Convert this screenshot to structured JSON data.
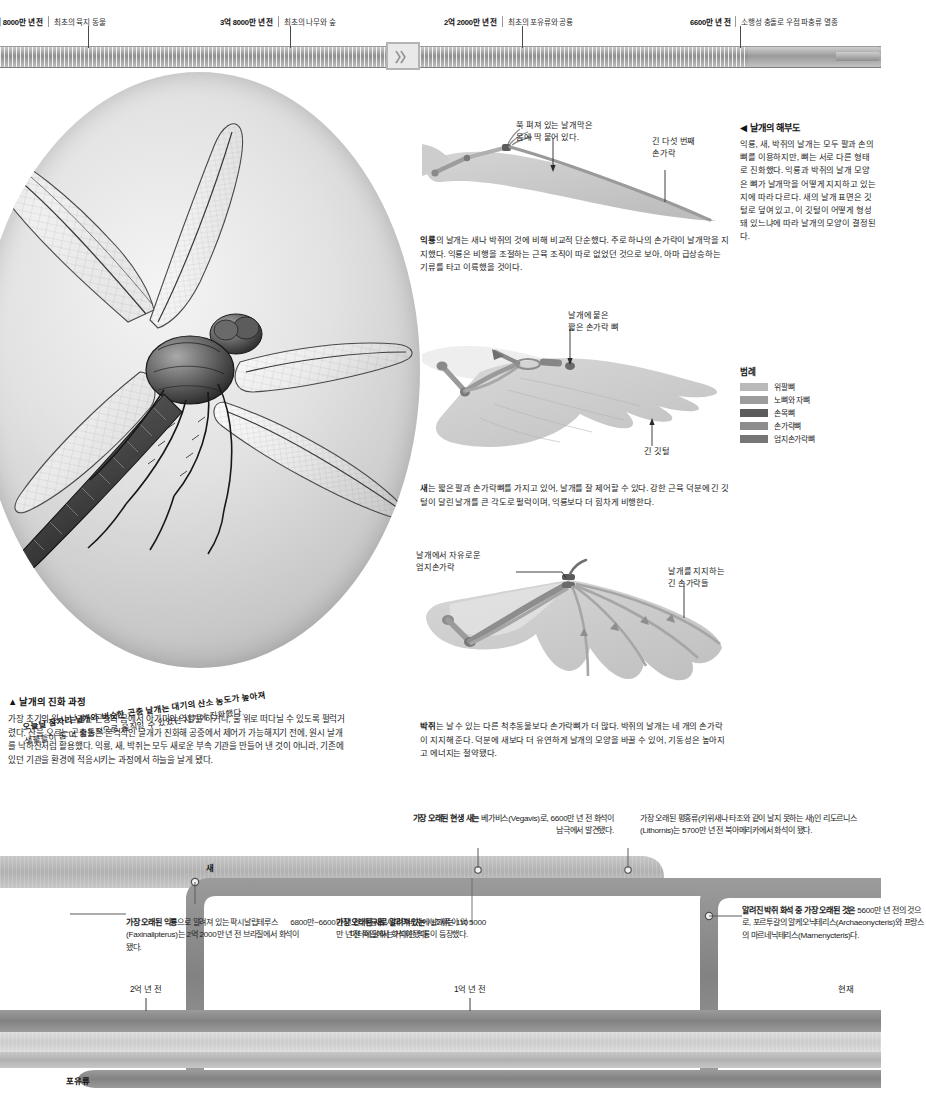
{
  "top_timeline": {
    "events": [
      {
        "age": "4억 8000만 년 전",
        "event": "최초의 육지 동물",
        "x": 88
      },
      {
        "age": "3억 8000만 년 전",
        "event": "최초의 나무와 숲",
        "x": 290
      },
      {
        "age": "2억 2000만 년 전",
        "event": "최초의 포유류와 공룡",
        "x": 522
      },
      {
        "age": "6600만 년 전",
        "event": "소행성 충돌로 우점 파충류 멸종",
        "x": 740
      }
    ],
    "break_glyph": "〉〉"
  },
  "dragonfly": {
    "caption_line1": "오늘날 잠자리 날개와 비슷한 곤충 날개는 대기의 산소 농도가 높아져",
    "caption_line2": "생물들이 좀 더 활동적으로 움직일 수 있었던 시기에 진화했다."
  },
  "evolution": {
    "heading": "▲ 날개의 진화 과정",
    "body": "가장 초기의 원시 날개는 곤충의 몸에서 아가미의 역할을 하거나, 물 위로 떠다닐 수 있도록 펄럭거렸다. 산을 오르는 곤충들은 본격적인 날개가 진화해 공중에서 제어가 가능해지기 전에, 원시 날개를 낙하산처럼 활용했다. 익룡, 새, 박쥐는 모두 새로운 부속 기관을 만들어 낸 것이 아니라, 기존에 있던 기관을 환경에 적응시키는 과정에서 하늘을 날게 됐다."
  },
  "anatomy": {
    "heading": "◀ 날개의 해부도",
    "body": "익룡, 새, 박쥐의 날개는 모두 팔과 손의 뼈를 이용하지만, 뼈는 서로 다른 형태로 진화했다. 익룡과 박쥐의 날개 모양은 뼈가 날개막을 어떻게 지지하고 있는지에 따라 다르다. 새의 날개 표면은 깃털로 덮여 있고, 이 깃털이 어떻게 형성돼 있느냐에 따라 날개의 모양이 결정된다."
  },
  "legend": {
    "title": "범례",
    "items": [
      {
        "label": "위팔뼈",
        "color": "#b9b9b9"
      },
      {
        "label": "노뼈와 자뼈",
        "color": "#9d9d9d"
      },
      {
        "label": "손목뼈",
        "color": "#5c5c5c"
      },
      {
        "label": "손가락뼈",
        "color": "#8c8c8c"
      },
      {
        "label": "엄지손가락뼈",
        "color": "#767676"
      }
    ]
  },
  "diagrams": [
    {
      "id": "pterosaur",
      "note_top": "쭉 펴져 있는 날개막은\n몸에 딱 붙어 있다.",
      "note_right": "긴 다섯 번째\n손가락",
      "caption_lead": "익룡",
      "caption_rest": "의 날개는 새나 박쥐의 것에 비해 비교적 단순했다. 주로 하나의 손가락이 날개막을 지지했다. 익룡은 비행을 조절하는 근육 조직이 따로 없었던 것으로 보아, 아마 급상승하는 기류를 타고 이륙했을 것이다."
    },
    {
      "id": "bird",
      "note_top": "날개에 붙은\n짧은 손가락 뼈",
      "note_bottom": "긴 깃털",
      "caption_lead": "새",
      "caption_rest": "는 짧은 팔과 손가락뼈를 가지고 있어, 날개를 잘 제어할 수 있다. 강한 근육 덕분에 긴 깃털이 달린 날개를 큰 각도로 펄럭이며, 익룡보다 더 힘차게 비행한다."
    },
    {
      "id": "bat",
      "note_left": "날개에서 자유로운\n엄지손가락",
      "note_right": "날개를 지지하는\n긴 손가락들",
      "caption_lead": "박쥐",
      "caption_rest": "는 날 수 있는 다른 척추동물보다 손가락뼈가 더 많다. 박쥐의 날개는 네 개의 손가락이 지지해 준다. 덕분에 새보다 더 유연하게 날개의 모양을 바꿀 수 있어, 기동성은 높아지고 에너지는 절약됐다."
    }
  ],
  "bottom_timeline": {
    "axis_ticks": [
      {
        "label": "2억 년 전",
        "x": 146
      },
      {
        "label": "1억 년 전",
        "x": 470
      },
      {
        "label": "현재",
        "x": 840
      }
    ],
    "track_labels": [
      {
        "label": "새",
        "x": 338,
        "y": 861
      },
      {
        "label": "포유류",
        "x": 68,
        "y": 1060
      }
    ],
    "notes": [
      {
        "id": "oldest-pterosaur",
        "align": "left",
        "x": 130,
        "y": 903,
        "w": 170,
        "bold": "가장 오래된 익룡",
        "rest": "으로 알려져 있는 팍시날립테루스(Faxinalipterus)는 2억 2000만 년 전 브라질에서 화석이 됐다."
      },
      {
        "id": "oldest-bird",
        "align": "left",
        "x": 340,
        "y": 903,
        "w": 150,
        "bold": "가장 오래된 새로 알려져 있는",
        "rest": " 시조새는 1억 5000만 년 전 독일에서 화석이 됐다."
      },
      {
        "id": "giant-pterosaur",
        "align": "right",
        "x": 478,
        "y": 903,
        "w": 178,
        "bold": "",
        "rest": "6800만~6600만 년 전, 익룡의 시대 막바지에 날개폭이 10미터에 달하는 거대한 익룡이 등장했다."
      },
      {
        "id": "oldest-living-bird",
        "align": "right",
        "x": 410,
        "y": 800,
        "w": 205,
        "bold": "가장 오래된 현생 새는",
        "rest": " 베가비스(Vegavis)로, 6600만 년 전 화석이 남극에서 발견됐다."
      },
      {
        "id": "oldest-ratite",
        "align": "left",
        "x": 655,
        "y": 800,
        "w": 225,
        "bold": "",
        "rest": "가장 오래된 평흉류(키위새나 타조와 같이 날지 못하는 새)인 리도르니스(Lithornis)는 5700만 년 전 북아메리카에서 화석이 됐다."
      },
      {
        "id": "oldest-bat-fossil",
        "align": "left",
        "x": 700,
        "y": 903,
        "w": 180,
        "bold": "알려진 박쥐 화석 중 가장 오래된 것은",
        "rest": " 5600만 년 전의 것으로, 포르투갈의 알케오닉테리스(Archaeonycteris)와 프랑스의 마르네닉테리스(Marnenycteris)다."
      }
    ],
    "colors": {
      "band_dark": "#8a8a8a",
      "band_mid": "#b7b7b7",
      "band_light": "#cfcfcf",
      "band_pale": "#dcdcdc",
      "outline": "#6f6f6f"
    }
  }
}
